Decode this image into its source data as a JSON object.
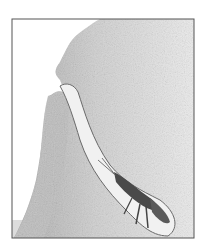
{
  "illustration": {
    "subject": "burrowing shrimp in sand burrow",
    "colors": {
      "background": "#ffffff",
      "frame": "#555555",
      "sand_dark": "#9a9a9a",
      "sand_light": "#e6e6e6",
      "burrow": "#f2f2f2",
      "shrimp": "#4a4a4a",
      "water_strip": "#dcdcdc"
    }
  }
}
